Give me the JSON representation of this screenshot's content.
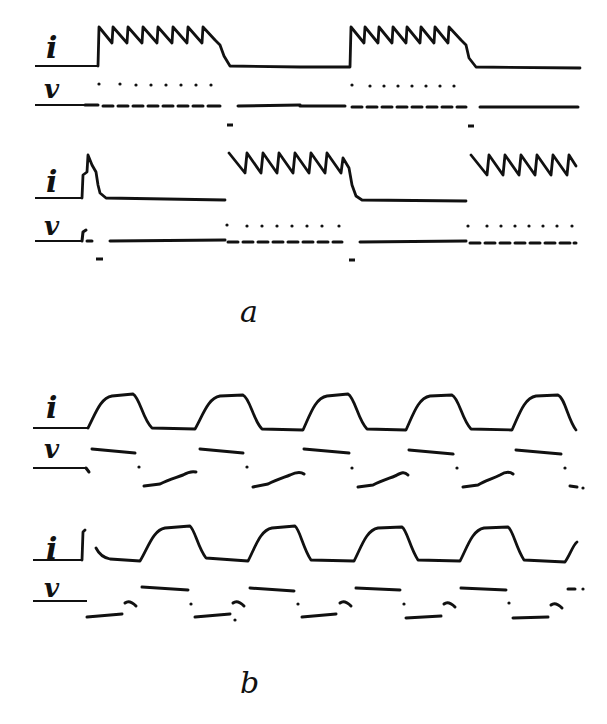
{
  "figure": {
    "background": "#ffffff",
    "ink": "#111111",
    "panels": [
      {
        "id": "a",
        "caption": "a",
        "caption_pos": [
          240,
          322
        ],
        "rows": [
          {
            "id": "a1",
            "i_label": "i",
            "i_label_pos": [
              46,
              58
            ],
            "v_label": "v",
            "v_label_pos": [
              44,
              98
            ],
            "i_axis": {
              "x1": 35,
              "x2": 98,
              "y": 66
            },
            "v_axis": {
              "x1": 35,
              "x2": 85,
              "y": 105
            },
            "i_trace": "M98,66 L99,27 L112,43 L113,27 L127,43 L128,27 L142,43 L143,27 L157,43 L158,27 L172,43 L173,27 L187,43 L188,27 L202,43 L203,27 L215,40 L220,45 L224,56 L230,66 L300,67 L350,67 L351,27 L364,43 L365,27 L378,43 L379,27 L392,43 L393,27 L406,43 L407,27 L420,43 L421,27 L434,43 L435,27 L448,43 L449,27 L461,40 L466,45 L469,58 L476,67 L580,68",
            "v_trace": [
              {
                "d": "M85,105 L98,105"
              },
              {
                "d": "M103,106 L113,106"
              },
              {
                "d": "M118,106 L128,106"
              },
              {
                "d": "M133,106 L143,106"
              },
              {
                "d": "M148,106 L158,106"
              },
              {
                "d": "M163,106 L173,106"
              },
              {
                "d": "M178,106 L188,106"
              },
              {
                "d": "M193,106 L203,106"
              },
              {
                "d": "M208,106 L220,106"
              },
              {
                "d": "M238,106 L300,105"
              },
              {
                "d": "M300,106 L345,106"
              },
              {
                "d": "M352,107 L362,107"
              },
              {
                "d": "M367,107 L377,107"
              },
              {
                "d": "M382,107 L392,107"
              },
              {
                "d": "M397,107 L407,107"
              },
              {
                "d": "M412,107 L422,107"
              },
              {
                "d": "M427,107 L437,107"
              },
              {
                "d": "M442,107 L452,107"
              },
              {
                "d": "M457,107 L466,107"
              },
              {
                "d": "M480,107 L578,107"
              }
            ],
            "v_dots": [
              [
                99,
                84
              ],
              [
                120,
                84
              ],
              [
                136,
                85
              ],
              [
                151,
                85
              ],
              [
                166,
                85
              ],
              [
                181,
                85
              ],
              [
                196,
                85
              ],
              [
                211,
                85
              ],
              [
                352,
                85
              ],
              [
                370,
                86
              ],
              [
                384,
                86
              ],
              [
                398,
                86
              ],
              [
                412,
                86
              ],
              [
                426,
                86
              ],
              [
                440,
                86
              ],
              [
                454,
                86
              ]
            ],
            "v_marks": [
              [
                227,
                125,
                233,
                125
              ],
              [
                468,
                126,
                474,
                126
              ]
            ]
          },
          {
            "id": "a2",
            "i_label": "i",
            "i_label_pos": [
              46,
              192
            ],
            "v_label": "v",
            "v_label_pos": [
              44,
              235
            ],
            "i_axis": {
              "x1": 35,
              "x2": 82,
              "y": 198
            },
            "v_axis": {
              "x1": 35,
              "x2": 82,
              "y": 241
            },
            "i_trace": "M82,198 L83,175 L87,172 L88,155 L92,165 L96,172 L98,185 L100,193 L106,198 L225,200 M229,153 L245,173 L247,153 L261,173 L263,153 L277,173 L279,153 L293,173 L295,153 L309,173 L311,153 L325,173 L327,153 L341,173 L343,158 L349,168 L352,185 L356,196 L362,200 L466,201 M471,155 L487,175 L489,155 L503,175 L505,155 L519,175 L521,155 L535,175 L537,155 L551,175 L553,155 L567,175 L569,155 L576,166",
            "v_trace": [
              {
                "d": "M82,241 L83,232 L86,230"
              },
              {
                "d": "M87,241 L92,241"
              },
              {
                "d": "M110,241 L225,240"
              },
              {
                "d": "M228,242 L238,242"
              },
              {
                "d": "M243,242 L253,242"
              },
              {
                "d": "M258,242 L268,242"
              },
              {
                "d": "M273,242 L283,242"
              },
              {
                "d": "M288,242 L298,242"
              },
              {
                "d": "M303,242 L313,242"
              },
              {
                "d": "M318,242 L328,242"
              },
              {
                "d": "M333,242 L342,242"
              },
              {
                "d": "M360,242 L466,241"
              },
              {
                "d": "M470,243 L480,243"
              },
              {
                "d": "M485,243 L495,243"
              },
              {
                "d": "M500,243 L510,243"
              },
              {
                "d": "M515,243 L525,243"
              },
              {
                "d": "M530,243 L540,243"
              },
              {
                "d": "M545,243 L555,243"
              },
              {
                "d": "M560,243 L570,243"
              },
              {
                "d": "M574,243 L576,243"
              }
            ],
            "v_dots": [
              [
                227,
                225
              ],
              [
                247,
                226
              ],
              [
                262,
                226
              ],
              [
                277,
                226
              ],
              [
                292,
                226
              ],
              [
                307,
                226
              ],
              [
                322,
                226
              ],
              [
                339,
                226
              ],
              [
                468,
                226
              ],
              [
                487,
                226
              ],
              [
                501,
                226
              ],
              [
                515,
                226
              ],
              [
                529,
                226
              ],
              [
                543,
                226
              ],
              [
                557,
                226
              ],
              [
                572,
                226
              ]
            ],
            "v_marks": [
              [
                96,
                259,
                103,
                259
              ],
              [
                349,
                260,
                355,
                260
              ]
            ]
          }
        ]
      },
      {
        "id": "b",
        "caption": "b",
        "caption_pos": [
          240,
          693
        ],
        "rows": [
          {
            "id": "b1",
            "i_label": "i",
            "i_label_pos": [
              46,
              418
            ],
            "v_label": "v",
            "v_label_pos": [
              44,
              458
            ],
            "i_axis": {
              "x1": 33,
              "x2": 88,
              "y": 428
            },
            "v_axis": {
              "x1": 33,
              "x2": 86,
              "y": 468
            },
            "i_trace": "M88,428 C95,415 100,398 112,396 L133,394 C140,398 143,420 152,428 L195,429 C203,415 208,398 220,396 L243,395 C250,398 253,420 262,429 L303,430 C310,415 315,398 327,396 L348,394 C355,398 358,420 367,429 L406,430 C413,415 418,398 430,396 L452,395 C459,398 462,420 471,429 L512,430 C519,415 524,398 536,396 L558,395 C565,398 568,420 576,430",
            "v_trace": [
              {
                "d": "M86,468 L89,472"
              },
              {
                "d": "M92,449 L135,453"
              },
              {
                "d": "M144,486 L160,484 C168,480 175,478 183,475 C188,472 192,471 196,472"
              },
              {
                "d": "M200,449 L243,453"
              },
              {
                "d": "M253,487 L268,484 C275,480 282,478 290,475 C296,472 300,471 304,474"
              },
              {
                "d": "M304,449 L349,453"
              },
              {
                "d": "M358,487 L373,485 C380,481 387,479 395,476 C401,473 404,471 408,475"
              },
              {
                "d": "M409,450 L453,454"
              },
              {
                "d": "M463,487 L478,485 C485,481 492,479 500,475 C505,472 509,471 513,474"
              },
              {
                "d": "M516,450 L561,454"
              },
              {
                "d": "M570,486 L577,487"
              }
            ],
            "v_dots": [
              [
                139,
                467
              ],
              [
                247,
                467
              ],
              [
                352,
                468
              ],
              [
                457,
                468
              ],
              [
                565,
                468
              ],
              [
                583,
                488
              ]
            ]
          },
          {
            "id": "b2",
            "i_label": "i",
            "i_label_pos": [
              46,
              559
            ],
            "v_label": "v",
            "v_label_pos": [
              44,
              597
            ],
            "i_axis": {
              "x1": 33,
              "x2": 82,
              "y": 560
            },
            "v_axis": {
              "x1": 33,
              "x2": 87,
              "y": 601
            },
            "i_trace": "M82,560 L83,532 L85,530 M96,548 C100,556 105,558 110,559 L140,561 C148,548 153,530 165,528 L190,526 C195,530 198,548 206,558 L248,561 C255,548 260,530 272,528 L295,526 C300,530 303,548 311,560 L354,561 C361,548 366,530 378,528 L402,527 C407,530 410,548 418,560 L460,561 C467,548 472,530 484,528 L508,527 C513,530 516,548 524,560 L565,562 C570,555 573,545 577,542",
            "v_trace": [
              {
                "d": "M87,617 L122,614"
              },
              {
                "d": "M125,603 C129,600 133,603 136,606"
              },
              {
                "d": "M142,587 L188,590"
              },
              {
                "d": "M195,617 L230,614"
              },
              {
                "d": "M233,603 C237,600 241,603 244,606"
              },
              {
                "d": "M250,588 L294,591"
              },
              {
                "d": "M302,617 L336,614"
              },
              {
                "d": "M340,603 C344,600 348,603 351,606"
              },
              {
                "d": "M356,588 L400,590"
              },
              {
                "d": "M406,618 L441,616"
              },
              {
                "d": "M444,604 C448,601 452,604 455,607"
              },
              {
                "d": "M461,588 L506,590"
              },
              {
                "d": "M513,618 L548,617"
              },
              {
                "d": "M551,605 C555,602 559,605 562,608"
              },
              {
                "d": "M568,589 L575,589"
              }
            ],
            "v_dots": [
              [
                191,
                604
              ],
              [
                235,
                620
              ],
              [
                298,
                604
              ],
              [
                404,
                604
              ],
              [
                509,
                603
              ],
              [
                583,
                589
              ]
            ]
          }
        ]
      }
    ]
  }
}
